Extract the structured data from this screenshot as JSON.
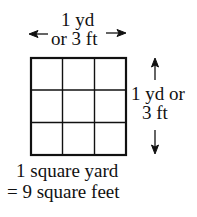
{
  "top_label": {
    "line1": "1 yd",
    "line2": "or 3 ft"
  },
  "side_label": {
    "line1": "1 yd or",
    "line2": "3 ft"
  },
  "caption": {
    "line1": "1 square yard",
    "line2": "= 9 square feet"
  },
  "grid": {
    "rows": 3,
    "cols": 3
  }
}
